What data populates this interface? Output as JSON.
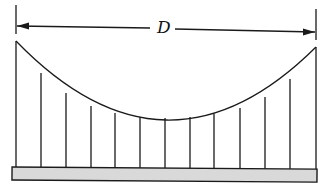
{
  "diagram": {
    "dimension_label": "D",
    "hanger_count": 13,
    "colors": {
      "line": "#1a1a1a",
      "deck_fill": "#d9d9d9"
    }
  }
}
